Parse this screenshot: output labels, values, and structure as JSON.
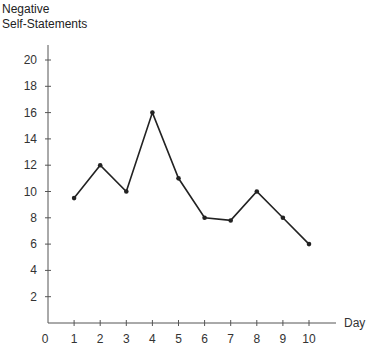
{
  "chart_data": {
    "type": "line",
    "title": "",
    "ylabel_lines": [
      "Negative",
      "Self-Statements"
    ],
    "xlabel": "Day",
    "x": [
      1,
      2,
      3,
      4,
      5,
      6,
      7,
      8,
      9,
      10
    ],
    "series": [
      {
        "name": "Negative Self-Statements",
        "values": [
          9.5,
          12,
          10,
          16,
          11,
          8,
          7.8,
          10,
          8,
          6
        ]
      }
    ],
    "xticks": [
      0,
      1,
      2,
      3,
      4,
      5,
      6,
      7,
      8,
      9,
      10
    ],
    "yticks": [
      2,
      4,
      6,
      8,
      10,
      12,
      14,
      16,
      18,
      20
    ],
    "xlim": [
      0,
      11
    ],
    "ylim": [
      0,
      22
    ],
    "grid": false,
    "legend": "none",
    "line_color": "#222222"
  }
}
